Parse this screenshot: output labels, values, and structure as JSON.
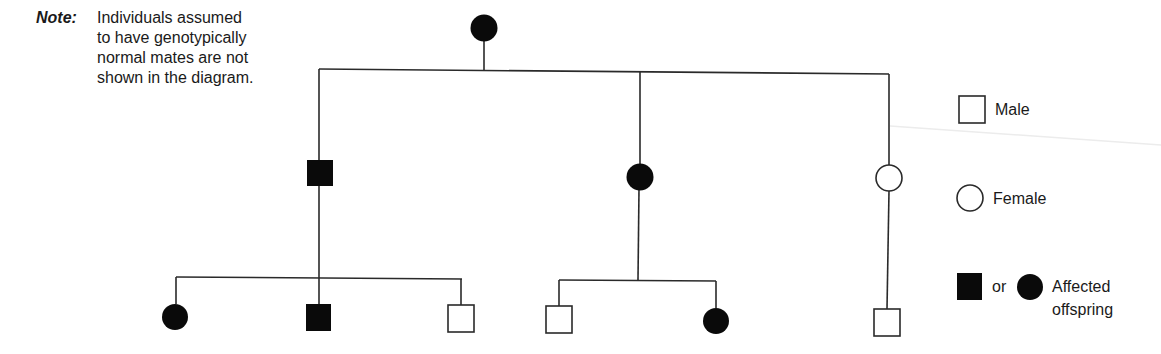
{
  "note": {
    "label": "Note:",
    "lines": [
      "Individuals assumed",
      "to have genotypically",
      "normal mates are not",
      "shown in the diagram."
    ]
  },
  "legend": {
    "male_label": "Male",
    "female_label": "Female",
    "or_label": "or",
    "affected_label_line1": "Affected",
    "affected_label_line2": "offspring"
  },
  "pedigree": {
    "generation_1": [
      {
        "id": "I-1",
        "sex": "female",
        "affected": true
      }
    ],
    "generation_2": [
      {
        "id": "II-1",
        "sex": "male",
        "affected": true
      },
      {
        "id": "II-2",
        "sex": "female",
        "affected": true
      },
      {
        "id": "II-3",
        "sex": "female",
        "affected": false
      }
    ],
    "generation_3": [
      {
        "id": "III-1",
        "parent": "II-1",
        "sex": "female",
        "affected": true
      },
      {
        "id": "III-2",
        "parent": "II-1",
        "sex": "male",
        "affected": true
      },
      {
        "id": "III-3",
        "parent": "II-1",
        "sex": "male",
        "affected": false
      },
      {
        "id": "III-4",
        "parent": "II-2",
        "sex": "male",
        "affected": false
      },
      {
        "id": "III-5",
        "parent": "II-2",
        "sex": "female",
        "affected": true
      },
      {
        "id": "III-6",
        "parent": "II-3",
        "sex": "male",
        "affected": false
      }
    ]
  },
  "colors": {
    "line": "#2a2a2a",
    "affected_fill": "#0a0a0a",
    "unaffected_fill": "#ffffff"
  }
}
